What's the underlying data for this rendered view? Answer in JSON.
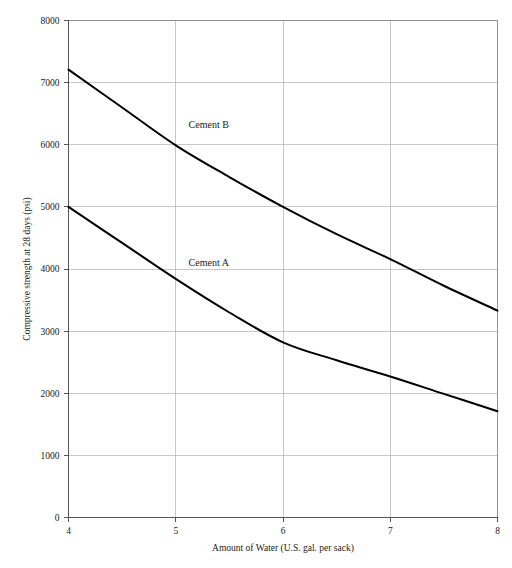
{
  "chart_data": {
    "type": "line",
    "title": "",
    "xlabel": "Amount of Water (U.S. gal. per sack)",
    "ylabel": "Compressive strength at 28 days (psi)",
    "xlim": [
      4,
      8
    ],
    "ylim": [
      0,
      8000
    ],
    "grid": true,
    "legend_position": "inline-annotation",
    "xticks": [
      4,
      5,
      6,
      7,
      8
    ],
    "xtick_labels": [
      "4",
      "5",
      "6",
      "7",
      "8"
    ],
    "yticks": [
      0,
      1000,
      2000,
      3000,
      4000,
      5000,
      6000,
      7000,
      8000
    ],
    "ytick_labels": [
      "0",
      "1000",
      "2000",
      "3000",
      "4000",
      "5000",
      "6000",
      "7000",
      "8000"
    ],
    "series": [
      {
        "name": "Cement B",
        "label_text": "Cement B",
        "label_x": 5.12,
        "label_y": 6330,
        "color": "#000000",
        "x": [
          4.0,
          4.5,
          5.0,
          5.5,
          6.0,
          6.5,
          7.0,
          7.5,
          8.0
        ],
        "values": [
          7210,
          6600,
          5990,
          5480,
          5000,
          4560,
          4160,
          3730,
          3330
        ]
      },
      {
        "name": "Cement A",
        "label_text": "Cement A",
        "label_x": 5.12,
        "label_y": 4110,
        "color": "#000000",
        "x": [
          4.0,
          4.5,
          5.0,
          5.5,
          6.0,
          6.5,
          7.0,
          7.5,
          8.0
        ],
        "values": [
          5000,
          4420,
          3840,
          3300,
          2820,
          2530,
          2270,
          1990,
          1710
        ]
      }
    ]
  },
  "axes": {
    "x_title": "Amount of Water (U.S. gal. per sack)",
    "y_title": "Compressive strength at 28 days (psi)"
  }
}
